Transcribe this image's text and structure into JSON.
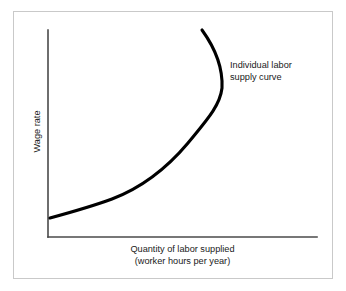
{
  "figure": {
    "background_color": "#ffffff",
    "frame_color": "#c9c9c9",
    "axis_color": "#4a4a4a",
    "curve_color": "#000000"
  },
  "chart_data": {
    "type": "line",
    "title": "",
    "subtitle": "",
    "xlabel": "Quantity of labor supplied\n(worker hours per year)",
    "ylabel": "Wage rate",
    "xlabel_line1": "Quantity of labor supplied",
    "xlabel_line2": "(worker hours per year)",
    "grid": false,
    "legend": false,
    "legend_position": "none",
    "xticks": [],
    "yticks": [],
    "xtick_labels": [],
    "ytick_labels": [],
    "xlim": [
      0,
      1
    ],
    "ylim": [
      0,
      1
    ],
    "axis_origin_px": [
      48,
      237
    ],
    "axis_top_px": [
      48,
      30
    ],
    "axis_right_px": [
      317,
      237
    ],
    "series": [
      {
        "name": "Individual labor supply curve",
        "description": "Backward-bending individual labor supply curve: upward sloping at low wage rates, bending back toward the left at high wage rates as the income effect dominates the substitution effect.",
        "color": "#000000",
        "stroke_width": 3.1,
        "points_px": [
          [
            50,
            218
          ],
          [
            80,
            209
          ],
          [
            110,
            200
          ],
          [
            140,
            184
          ],
          [
            170,
            160
          ],
          [
            195,
            133
          ],
          [
            212,
            110
          ],
          [
            221,
            95
          ],
          [
            222,
            80
          ],
          [
            216,
            57
          ],
          [
            202,
            30
          ]
        ],
        "path_d": "M 50 218 C 72 212 93 206 112 199 C 141 188 167 168 188 143 C 206 121 220 106 222 88 C 223 68 215 48 202 30"
      }
    ],
    "annotations": [
      {
        "name": "curve-label",
        "text": "Individual labor\nsupply curve",
        "line1": "Individual labor",
        "line2": "supply curve",
        "position_px": [
          230,
          60
        ]
      }
    ]
  }
}
